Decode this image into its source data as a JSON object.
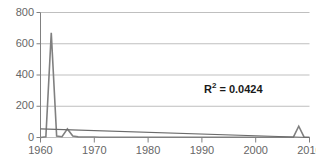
{
  "chart_data": {
    "type": "line",
    "title": "",
    "xlabel": "",
    "ylabel": "",
    "xlim": [
      1960,
      2010
    ],
    "ylim": [
      0,
      800
    ],
    "grid": true,
    "legend": false,
    "xticks": [
      1960,
      1970,
      1980,
      1990,
      2000,
      2010
    ],
    "yticks": [
      0,
      200,
      400,
      600,
      800
    ],
    "annotations": [
      {
        "name": "r-squared",
        "text": "R² = 0.0424",
        "r_label": "R",
        "superscript": "2",
        "equals_value": " = 0.0424",
        "x": 1992,
        "y": 300
      }
    ],
    "series": [
      {
        "name": "data",
        "color": "#808080",
        "width": 1.6,
        "x": [
          1960,
          1961,
          1962,
          1963,
          1964,
          1965,
          1966,
          1967,
          1968,
          1969,
          1970,
          1971,
          1972,
          1973,
          1974,
          1975,
          1976,
          1977,
          1978,
          1979,
          1980,
          1981,
          1982,
          1983,
          1984,
          1985,
          1986,
          1987,
          1988,
          1989,
          1990,
          1991,
          1992,
          1993,
          1994,
          1995,
          1996,
          1997,
          1998,
          1999,
          2000,
          2001,
          2002,
          2003,
          2004,
          2005,
          2006,
          2007,
          2008,
          2009,
          2010
        ],
        "y": [
          0,
          5,
          670,
          10,
          5,
          55,
          10,
          4,
          3,
          3,
          3,
          2,
          2,
          2,
          2,
          2,
          2,
          2,
          2,
          2,
          2,
          2,
          2,
          2,
          2,
          2,
          2,
          2,
          2,
          2,
          2,
          2,
          2,
          2,
          2,
          2,
          2,
          2,
          2,
          2,
          2,
          2,
          2,
          2,
          2,
          2,
          2,
          2,
          72,
          2,
          2
        ]
      },
      {
        "name": "trendline",
        "color": "#6b6b6b",
        "width": 1.2,
        "x": [
          1960,
          2010
        ],
        "y": [
          55,
          0
        ]
      }
    ]
  },
  "axes": {
    "y_tick_labels": [
      "800",
      "600",
      "400",
      "200",
      "0"
    ],
    "x_tick_labels": [
      "1960",
      "1970",
      "1980",
      "1990",
      "2000",
      "2010"
    ]
  },
  "colors": {
    "grid": "#bfbfbf",
    "axis": "#808080",
    "tick_text": "#666666",
    "series": "#808080",
    "trend": "#6b6b6b",
    "annotation": "#1a1a1a"
  }
}
